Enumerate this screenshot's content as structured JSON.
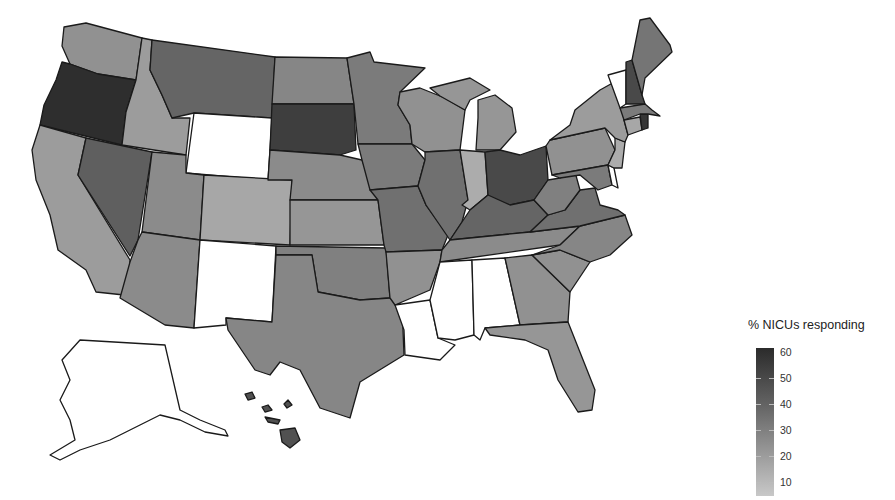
{
  "chart_data": {
    "type": "choropleth",
    "title": "",
    "legend": {
      "title": "% NICUs responding",
      "ticks": [
        60,
        50,
        40,
        30,
        20,
        10
      ],
      "range": [
        0,
        60
      ],
      "scale": "grayscale continuous (light = low, dark = high)",
      "position": "bottom-right"
    },
    "values": {
      "Washington": 22,
      "Oregon": 58,
      "California": 18,
      "Nevada": 40,
      "Idaho": 18,
      "Montana": 38,
      "Wyoming": 0,
      "Utah": 24,
      "Colorado": 14,
      "Arizona": 24,
      "New Mexico": 0,
      "North Dakota": 26,
      "South Dakota": 52,
      "Nebraska": 24,
      "Kansas": 20,
      "Oklahoma": 28,
      "Texas": 26,
      "Minnesota": 30,
      "Iowa": 30,
      "Missouri": 34,
      "Arkansas": 22,
      "Louisiana": 0,
      "Wisconsin": 22,
      "Illinois": 34,
      "Michigan": 20,
      "Indiana": 12,
      "Ohio": 48,
      "Kentucky": 38,
      "Tennessee": 24,
      "Mississippi": 0,
      "Alabama": 0,
      "Georgia": 22,
      "Florida": 20,
      "South Carolina": 22,
      "North Carolina": 26,
      "Virginia": 34,
      "West Virginia": 28,
      "Pennsylvania": 22,
      "New York": 18,
      "Vermont": 0,
      "New Hampshire": 48,
      "Maine": 32,
      "Massachusetts": 30,
      "Rhode Island": 55,
      "Connecticut": 14,
      "New Jersey": 12,
      "Delaware": 0,
      "Maryland": 30,
      "Alaska": 0,
      "Hawaii": 45
    }
  },
  "legend": {
    "title": "% NICUs responding",
    "ticks": [
      {
        "label": "60",
        "y": 0
      },
      {
        "label": "50",
        "y": 26
      },
      {
        "label": "40",
        "y": 52
      },
      {
        "label": "30",
        "y": 78
      },
      {
        "label": "20",
        "y": 104
      },
      {
        "label": "10",
        "y": 130
      }
    ]
  },
  "colors": {
    "v0": "#ffffff",
    "v10": "#c2c2c2",
    "v20": "#a8a8a8",
    "v30": "#8c8c8c",
    "v40": "#6e6e6e",
    "v50": "#505050",
    "v60": "#2e2e2e",
    "stroke": "#1a1a1a"
  }
}
